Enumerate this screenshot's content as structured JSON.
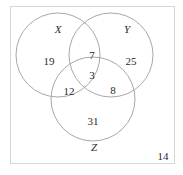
{
  "diagram": {
    "type": "venn-3",
    "sets": [
      {
        "name": "X",
        "label": "X"
      },
      {
        "name": "Y",
        "label": "Y"
      },
      {
        "name": "Z",
        "label": "Z"
      }
    ],
    "regions": {
      "x_only": "19",
      "y_only": "25",
      "z_only": "31",
      "x_and_y_only": "7",
      "x_and_z_only": "12",
      "y_and_z_only": "8",
      "x_y_z": "3",
      "outside": "14"
    },
    "colors": {
      "circle_stroke": "#a8a8a8",
      "frame_border": "#d6d6d6",
      "text": "#2a2a2a"
    }
  }
}
